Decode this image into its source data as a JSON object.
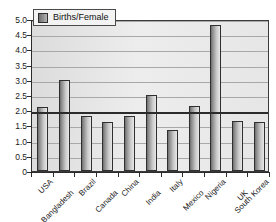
{
  "chart_data": {
    "type": "bar",
    "title": "",
    "xlabel": "",
    "ylabel": "",
    "ylim": [
      0,
      5.0
    ],
    "ytick_step": 0.5,
    "grid": true,
    "legend_position": "top-left",
    "categories": [
      "USA",
      "Bangladesh",
      "Brazil",
      "Canada",
      "China",
      "India",
      "Italy",
      "Mexico",
      "Nigeria",
      "UK",
      "South Korea"
    ],
    "series": [
      {
        "name": "Births/Female",
        "values": [
          2.1,
          3.0,
          1.8,
          1.6,
          1.8,
          2.5,
          1.35,
          2.15,
          4.8,
          1.65,
          1.6
        ]
      }
    ],
    "ytick_labels": [
      "0",
      "0.5",
      "1.0",
      "1.5",
      "2.0",
      "2.5",
      "3.0",
      "3.5",
      "4.0",
      "4.5",
      "5.0"
    ],
    "ytick_values": [
      0,
      0.5,
      1.0,
      1.5,
      2.0,
      2.5,
      3.0,
      3.5,
      4.0,
      4.5,
      5.0
    ],
    "reference_line": 2.0,
    "annotations": []
  },
  "legend": {
    "swatch_name": "births-per-female-swatch",
    "label": "Births/Female"
  },
  "colors": {
    "bar_dark": "#6e6e6e",
    "bar_light": "#e8e8e8",
    "plot_background": "#e2e2e2",
    "gridline": "#a8a8a8",
    "axis": "#2b2b2b",
    "text": "#1a1a1a"
  }
}
